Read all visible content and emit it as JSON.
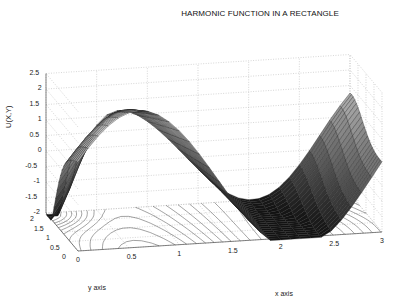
{
  "chart_data": {
    "type": "surface3d",
    "title": "HARMONIC FUNCTION IN A RECTANGLE",
    "xlabel": "x axis",
    "ylabel": "y axis",
    "zlabel": "U(X,Y)",
    "xlim": [
      0,
      3
    ],
    "ylim": [
      0,
      2
    ],
    "zlim": [
      -2,
      2.5
    ],
    "x_ticks": [
      "0",
      "0.5",
      "1",
      "1.5",
      "2",
      "2.5",
      "3"
    ],
    "y_ticks": [
      "0",
      "0.5",
      "1",
      "1.5",
      "2"
    ],
    "z_ticks": [
      "2.5",
      "2",
      "1.5",
      "1",
      "0.5",
      "0",
      "-0.5",
      "-1",
      "-1.5",
      "-2"
    ],
    "grid": true,
    "colormap": "gray",
    "contour_projection": true,
    "features": {
      "max_regions": "ridge near x≈0.5 along y=0..2 reaching ~2.4; rise near x=3, y=2 ~0.5",
      "min_regions": "x=0,y=2 ≈ -2; x≈1.5,y=0 ≈ -2"
    }
  },
  "labels": {
    "title": "HARMONIC FUNCTION IN A RECTANGLE",
    "xaxis": "x axis",
    "yaxis": "y axis",
    "zaxis": "U(X,Y)"
  }
}
